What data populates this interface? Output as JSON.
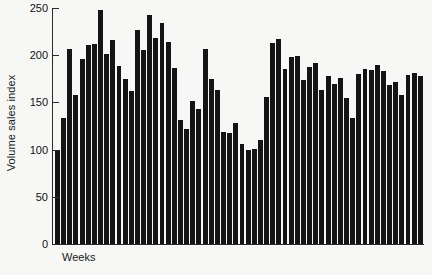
{
  "chart_data": {
    "type": "bar",
    "title": "",
    "subtitle": "",
    "xlabel": "Weeks",
    "ylabel": "Volume sales index",
    "ylim": [
      0,
      250
    ],
    "ytick_values": [
      0,
      50,
      100,
      150,
      200,
      250
    ],
    "ytick_labels": [
      "0",
      "50",
      "100",
      "150",
      "200",
      "250"
    ],
    "grid": false,
    "legend": null,
    "bar_color": "#141414",
    "background_color": "#f7f7f5",
    "axis_color": "#2a2a2a",
    "categories": [
      "1",
      "2",
      "3",
      "4",
      "5",
      "6",
      "7",
      "8",
      "9",
      "10",
      "11",
      "12",
      "13",
      "14",
      "15",
      "16",
      "17",
      "18",
      "19",
      "20",
      "21",
      "22",
      "23",
      "24",
      "25",
      "26",
      "27",
      "28",
      "29",
      "30",
      "31",
      "32",
      "33",
      "34",
      "35",
      "36",
      "37",
      "38",
      "39",
      "40",
      "41",
      "42",
      "43",
      "44",
      "45",
      "46",
      "47",
      "48",
      "49",
      "50",
      "51",
      "52",
      "53",
      "54",
      "55",
      "56",
      "57",
      "58",
      "59",
      "60"
    ],
    "values": [
      100,
      133,
      207,
      158,
      196,
      211,
      212,
      248,
      201,
      216,
      189,
      175,
      162,
      227,
      205,
      243,
      218,
      234,
      214,
      186,
      131,
      122,
      152,
      143,
      207,
      175,
      163,
      119,
      118,
      128,
      106,
      100,
      101,
      110,
      156,
      213,
      217,
      185,
      198,
      199,
      174,
      188,
      192,
      163,
      178,
      170,
      176,
      155,
      133,
      180,
      185,
      184,
      190,
      183,
      168,
      172,
      158,
      179,
      181,
      178
    ],
    "n_bars": 60,
    "annotations": []
  }
}
